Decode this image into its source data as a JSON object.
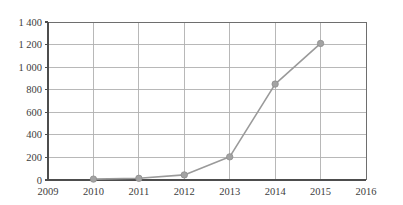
{
  "chart_data": {
    "type": "line",
    "title": "",
    "subtitle": "",
    "xlabel": "",
    "ylabel": "",
    "categories": [
      "2009",
      "2010",
      "2011",
      "2012",
      "2013",
      "2014",
      "2015",
      "2016"
    ],
    "x": [
      2009,
      2010,
      2011,
      2012,
      2013,
      2014,
      2015,
      2016
    ],
    "series": [
      {
        "name": "",
        "x": [
          2010,
          2011,
          2012,
          2013,
          2014,
          2015
        ],
        "values": [
          8,
          15,
          45,
          205,
          850,
          1210
        ],
        "color": "#9a9a9a",
        "marker": "circle"
      }
    ],
    "xlim": [
      2009,
      2016
    ],
    "ylim": [
      0,
      1400
    ],
    "ytick_values": [
      0,
      200,
      400,
      600,
      800,
      1000,
      1200,
      1400
    ],
    "ytick_labels": [
      "0",
      "200",
      "400",
      "600",
      "800",
      "1 000",
      "1 200",
      "1 400"
    ],
    "xtick_labels": [
      "2009",
      "2010",
      "2011",
      "2012",
      "2013",
      "2014",
      "2015",
      "2016"
    ],
    "grid": true,
    "grid_axis": "both",
    "legend": false,
    "legend_position": "none",
    "annotations": []
  },
  "style": {
    "grid_color": "#b0b0b0",
    "axis_color": "#4d4d4d",
    "frame_color": "#6e6e6e",
    "series_color": "#9a9a9a",
    "marker_color": "#a3a3a3",
    "text_color": "#3d3d3d",
    "background": "#ffffff"
  },
  "geometry": {
    "plot_left": 48,
    "plot_right": 366,
    "plot_top": 22,
    "plot_bottom": 180,
    "marker_radius": 3.2
  }
}
